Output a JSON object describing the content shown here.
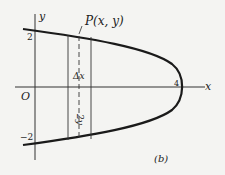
{
  "figure": {
    "label": "(b)",
    "axes": {
      "x_label": "x",
      "y_label": "y",
      "origin_label": "O"
    },
    "ticks": {
      "y_top": "2",
      "y_bottom": "−2",
      "x_vertex": "4"
    },
    "point_label": "P(x, y)",
    "strip_width_label": "Δx",
    "strip_height_label": "2y",
    "colors": {
      "curve": "#1a1a1a",
      "axis": "#333333",
      "background": "#f4f4f2"
    }
  }
}
